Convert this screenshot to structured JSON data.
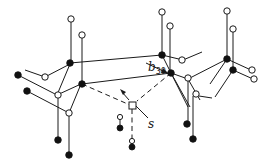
{
  "diagram": {
    "labels": {
      "bond_label_main": "b",
      "bond_label_sub": "30",
      "site_label": "s"
    },
    "legend": {
      "open_circle": "open-atom",
      "filled_circle": "filled-atom",
      "open_square": "site-s"
    },
    "colors": {
      "line": "#1a1a1a",
      "fill": "#111111",
      "background": "#ffffff"
    }
  }
}
